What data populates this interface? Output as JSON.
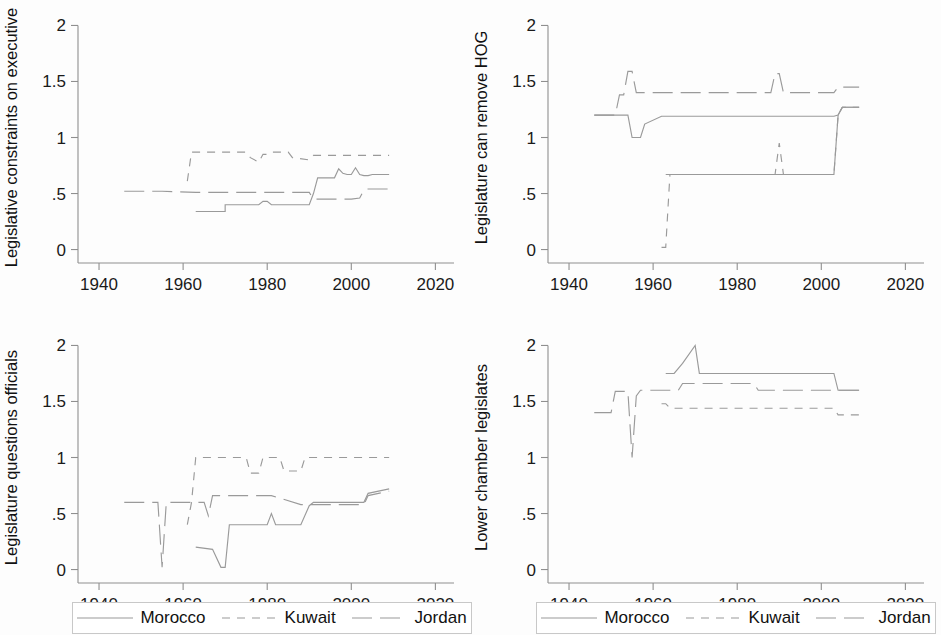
{
  "figure": {
    "background_color": "#fdfdfd",
    "line_color": "#9a9a9a",
    "axis_color": "#8f8f8f",
    "text_color": "#1a1a1a"
  },
  "legend": {
    "entries": [
      {
        "label": "Morocco",
        "dash": "solid",
        "dasharray": ""
      },
      {
        "label": "Kuwait",
        "dash": "short-dash",
        "dasharray": "8,7"
      },
      {
        "label": "Jordan",
        "dash": "long-dash",
        "dasharray": "20,8"
      }
    ]
  },
  "chart_data": [
    {
      "id": "legislative-constraints-on-executive",
      "type": "line",
      "title": "",
      "xlabel": "",
      "ylabel": "Legislative constraints on executive",
      "xlim": [
        1935,
        2023
      ],
      "ylim": [
        -0.12,
        2.12
      ],
      "xticks": [
        1940,
        1960,
        1980,
        2000,
        2020
      ],
      "xticklabels": [
        "1940",
        "1960",
        "1980",
        "2000",
        "2020"
      ],
      "yticks": [
        0,
        0.5,
        1,
        1.5,
        2
      ],
      "yticklabels": [
        "0",
        ".5",
        "1",
        "1.5",
        "2"
      ],
      "grid": false,
      "legend_position": "below",
      "series": [
        {
          "name": "Morocco",
          "dasharray": "",
          "x": [
            1963,
            1970,
            1970,
            1978,
            1979,
            1980,
            1981,
            1990,
            1991,
            1992,
            1993,
            1996,
            1997,
            1998,
            1999,
            2000,
            2001,
            2002,
            2003,
            2004,
            2005,
            2009
          ],
          "y": [
            0.34,
            0.34,
            0.4,
            0.4,
            0.43,
            0.43,
            0.4,
            0.4,
            0.5,
            0.64,
            0.64,
            0.64,
            0.72,
            0.68,
            0.67,
            0.67,
            0.73,
            0.67,
            0.66,
            0.66,
            0.67,
            0.67
          ]
        },
        {
          "name": "Kuwait",
          "dasharray": "8,7",
          "x": [
            1961,
            1962,
            1963,
            1975,
            1976,
            1978,
            1979,
            1980,
            1981,
            1985,
            1986,
            1990,
            1991,
            1992,
            2009
          ],
          "y": [
            0.61,
            0.87,
            0.87,
            0.87,
            0.82,
            0.78,
            0.85,
            0.85,
            0.87,
            0.87,
            0.82,
            0.8,
            0.84,
            0.84,
            0.84
          ]
        },
        {
          "name": "Jordan",
          "dasharray": "20,8",
          "x": [
            1946,
            1955,
            1963,
            1970,
            1980,
            1989,
            1990,
            1991,
            1993,
            2000,
            2002,
            2003,
            2004,
            2009
          ],
          "y": [
            0.52,
            0.52,
            0.51,
            0.51,
            0.51,
            0.51,
            0.51,
            0.45,
            0.45,
            0.45,
            0.46,
            0.53,
            0.54,
            0.54
          ]
        }
      ]
    },
    {
      "id": "legislature-can-remove-hog",
      "type": "line",
      "title": "",
      "xlabel": "",
      "ylabel": "Legislature can remove HOG",
      "xlim": [
        1935,
        2023
      ],
      "ylim": [
        -0.12,
        2.12
      ],
      "xticks": [
        1940,
        1960,
        1980,
        2000,
        2020
      ],
      "xticklabels": [
        "1940",
        "1960",
        "1980",
        "2000",
        "2020"
      ],
      "yticks": [
        0,
        0.5,
        1,
        1.5,
        2
      ],
      "yticklabels": [
        "0",
        ".5",
        "1",
        "1.5",
        "2"
      ],
      "grid": false,
      "legend_position": "below",
      "series": [
        {
          "name": "Morocco",
          "dasharray": "",
          "x": [
            1963,
            1990,
            1991,
            2003,
            2004,
            2005,
            2009
          ],
          "y": [
            0.67,
            0.67,
            0.67,
            0.67,
            1.2,
            1.27,
            1.27
          ]
        },
        {
          "name": "Kuwait",
          "dasharray": "8,7",
          "x": [
            1962,
            1963,
            1964,
            1989,
            1990,
            1991,
            1992,
            2002,
            2003,
            2004,
            2005,
            2009
          ],
          "y": [
            0.02,
            0.02,
            0.67,
            0.67,
            0.95,
            0.67,
            0.67,
            0.67,
            0.67,
            1.2,
            1.27,
            1.27
          ]
        },
        {
          "name": "Jordan",
          "dasharray": "20,8",
          "x": [
            1946,
            1951,
            1952,
            1953,
            1954,
            1955,
            1956,
            1957,
            1958,
            1962,
            1963,
            1988,
            1989,
            1990,
            1991,
            1992,
            2003,
            2004,
            2005,
            2009
          ],
          "y": [
            1.2,
            1.2,
            1.38,
            1.38,
            1.59,
            1.59,
            1.4,
            1.4,
            1.4,
            1.4,
            1.4,
            1.4,
            1.57,
            1.57,
            1.4,
            1.4,
            1.4,
            1.45,
            1.45,
            1.45
          ]
        },
        {
          "name": "Jordan-lower",
          "dasharray": "",
          "x": [
            1946,
            1951,
            1954,
            1955,
            1956,
            1957,
            1958,
            1962,
            1963,
            2003,
            2004,
            2005,
            2009
          ],
          "y": [
            1.2,
            1.2,
            1.2,
            1.0,
            1.0,
            1.0,
            1.12,
            1.19,
            1.19,
            1.19,
            1.2,
            1.27,
            1.27
          ]
        }
      ]
    },
    {
      "id": "legislature-questions-officials",
      "type": "line",
      "title": "",
      "xlabel": "",
      "ylabel": "Legislature questions officials",
      "xlim": [
        1935,
        2023
      ],
      "ylim": [
        -0.12,
        2.12
      ],
      "xticks": [
        1940,
        1960,
        1980,
        2000,
        2020
      ],
      "xticklabels": [
        "1940",
        "1960",
        "1980",
        "2000",
        "2020"
      ],
      "yticks": [
        0,
        0.5,
        1,
        1.5,
        2
      ],
      "yticklabels": [
        "0",
        ".5",
        "1",
        "1.5",
        "2"
      ],
      "grid": false,
      "legend_position": "below",
      "series": [
        {
          "name": "Morocco",
          "dasharray": "",
          "x": [
            1963,
            1967,
            1969,
            1970,
            1971,
            1980,
            1981,
            1982,
            1983,
            1988,
            1990,
            1991,
            2003,
            2004,
            2009
          ],
          "y": [
            0.2,
            0.18,
            0.02,
            0.02,
            0.4,
            0.4,
            0.5,
            0.4,
            0.4,
            0.4,
            0.57,
            0.6,
            0.6,
            0.68,
            0.72
          ]
        },
        {
          "name": "Kuwait",
          "dasharray": "8,7",
          "x": [
            1961,
            1962,
            1963,
            1975,
            1976,
            1978,
            1979,
            1983,
            1984,
            1988,
            1989,
            1991,
            1992,
            2009
          ],
          "y": [
            0.4,
            0.6,
            1.0,
            1.0,
            0.86,
            0.86,
            1.0,
            1.0,
            0.88,
            0.88,
            1.0,
            1.0,
            1.0,
            1.0
          ]
        },
        {
          "name": "Jordan",
          "dasharray": "20,8",
          "x": [
            1946,
            1954,
            1955,
            1956,
            1957,
            1962,
            1965,
            1966,
            1967,
            1980,
            1981,
            1988,
            1989,
            2003,
            2004,
            2009
          ],
          "y": [
            0.6,
            0.6,
            0.02,
            0.6,
            0.6,
            0.6,
            0.6,
            0.48,
            0.66,
            0.66,
            0.66,
            0.58,
            0.58,
            0.58,
            0.66,
            0.7
          ]
        }
      ]
    },
    {
      "id": "lower-chamber-legislates",
      "type": "line",
      "title": "",
      "xlabel": "",
      "ylabel": "Lower chamber legislates",
      "xlim": [
        1935,
        2023
      ],
      "ylim": [
        -0.12,
        2.12
      ],
      "xticks": [
        1940,
        1960,
        1980,
        2000,
        2020
      ],
      "xticklabels": [
        "1940",
        "1960",
        "1980",
        "2000",
        "2020"
      ],
      "yticks": [
        0,
        0.5,
        1,
        1.5,
        2
      ],
      "yticklabels": [
        "0",
        ".5",
        "1",
        "1.5",
        "2"
      ],
      "grid": false,
      "legend_position": "below",
      "series": [
        {
          "name": "Morocco",
          "dasharray": "",
          "x": [
            1963,
            1965,
            1967,
            1970,
            1971,
            1984,
            1985,
            2003,
            2004,
            2009
          ],
          "y": [
            1.75,
            1.75,
            1.84,
            2.0,
            1.75,
            1.75,
            1.75,
            1.75,
            1.6,
            1.6
          ]
        },
        {
          "name": "Kuwait",
          "dasharray": "8,7",
          "x": [
            1962,
            1963,
            1964,
            1966,
            1967,
            1984,
            1985,
            2003,
            2004,
            2009
          ],
          "y": [
            1.48,
            1.48,
            1.44,
            1.44,
            1.44,
            1.44,
            1.44,
            1.44,
            1.38,
            1.38
          ]
        },
        {
          "name": "Jordan",
          "dasharray": "20,8",
          "x": [
            1946,
            1950,
            1951,
            1952,
            1954,
            1955,
            1956,
            1957,
            1958,
            1966,
            1967,
            1984,
            1985,
            2003,
            2004,
            2009
          ],
          "y": [
            1.4,
            1.4,
            1.59,
            1.59,
            1.59,
            1.0,
            1.55,
            1.6,
            1.6,
            1.6,
            1.66,
            1.66,
            1.6,
            1.6,
            1.6,
            1.6
          ]
        }
      ]
    }
  ]
}
